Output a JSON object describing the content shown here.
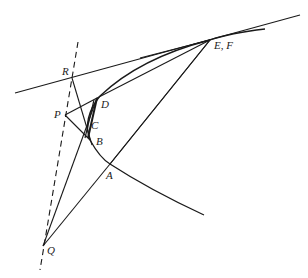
{
  "diagram": {
    "labels": {
      "R": "R",
      "EF": "E, F",
      "P": "P",
      "D": "D",
      "C": "C",
      "B": "B",
      "A": "A",
      "Q": "Q"
    },
    "stroke_color": "#1a1a1a"
  }
}
